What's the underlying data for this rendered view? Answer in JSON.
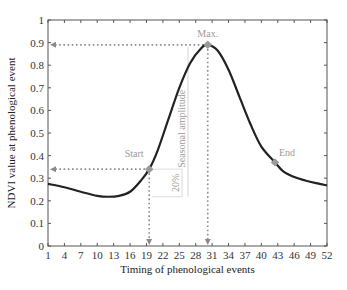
{
  "chart_data": {
    "type": "line",
    "title": "",
    "xlabel": "Timing of phenological events",
    "ylabel": "NDVI value at phenological event",
    "xlim": [
      1,
      52
    ],
    "ylim": [
      0,
      1
    ],
    "x_ticks": [
      "1",
      "4",
      "7",
      "10",
      "13",
      "16",
      "19",
      "22",
      "25",
      "28",
      "31",
      "34",
      "37",
      "40",
      "43",
      "46",
      "49",
      "52"
    ],
    "y_ticks": [
      "0",
      "0.1",
      "0.2",
      "0.3",
      "0.4",
      "0.5",
      "0.6",
      "0.7",
      "0.8",
      "0.9",
      "1"
    ],
    "grid": false,
    "legend": null,
    "series": [
      {
        "name": "NDVI curve",
        "x": [
          1,
          4,
          7,
          10,
          12,
          14,
          16,
          18,
          19.5,
          21,
          23,
          25,
          27,
          29,
          30.2,
          32,
          34,
          36,
          38,
          40,
          42.5,
          44,
          46,
          48,
          50,
          52
        ],
        "y": [
          0.275,
          0.26,
          0.24,
          0.222,
          0.218,
          0.222,
          0.24,
          0.29,
          0.34,
          0.42,
          0.56,
          0.7,
          0.81,
          0.875,
          0.89,
          0.865,
          0.78,
          0.66,
          0.54,
          0.44,
          0.37,
          0.33,
          0.305,
          0.29,
          0.278,
          0.268
        ]
      }
    ],
    "points": [
      {
        "label": "Start",
        "x": 19.5,
        "y": 0.34
      },
      {
        "label": "Max.",
        "x": 30.2,
        "y": 0.89
      },
      {
        "label": "End",
        "x": 42.5,
        "y": 0.37
      }
    ],
    "annotations": [
      {
        "text": "Seasonal amplitude",
        "type": "vertical-bracket",
        "from": 0.218,
        "to": 0.89
      },
      {
        "text": "20%",
        "type": "vertical-bracket",
        "from": 0.218,
        "to": 0.34
      }
    ]
  }
}
